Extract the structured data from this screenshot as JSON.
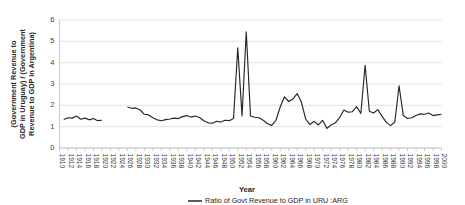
{
  "chart_data": {
    "type": "line",
    "title": "",
    "xlabel": "Year",
    "ylabel": "(Government Revenue to GDP in Uruguay) / (Government Revenue to GDP in Argentina)",
    "ylabel_lines": [
      "(Government Revenue to",
      "GDP in Uruguay) / (Government",
      "Revenue to GDP in Argentina)"
    ],
    "ylim": [
      0,
      6
    ],
    "yticks": [
      0,
      1,
      2,
      3,
      4,
      5,
      6
    ],
    "ytick_labels": [
      "0",
      "1",
      "2",
      "3",
      "4",
      "5",
      "6"
    ],
    "xlim": [
      1910,
      2000
    ],
    "xticks": [
      1910,
      1912,
      1914,
      1916,
      1918,
      1920,
      1922,
      1924,
      1926,
      1928,
      1930,
      1932,
      1934,
      1936,
      1938,
      1940,
      1942,
      1944,
      1946,
      1948,
      1950,
      1952,
      1954,
      1956,
      1958,
      1960,
      1962,
      1964,
      1966,
      1968,
      1970,
      1972,
      1974,
      1976,
      1978,
      1980,
      1982,
      1984,
      1986,
      1988,
      1990,
      1992,
      1994,
      1996,
      1998,
      2000
    ],
    "xtick_labels": [
      "1910",
      "1912",
      "1914",
      "1916",
      "1918",
      "1920",
      "1922",
      "1924",
      "1926",
      "1928",
      "1930",
      "1932",
      "1934",
      "1936",
      "1938",
      "1940",
      "1942",
      "1944",
      "1946",
      "1948",
      "1950",
      "1952",
      "1954",
      "1956",
      "1958",
      "1960",
      "1962",
      "1964",
      "1966",
      "1968",
      "1970",
      "1972",
      "1974",
      "1976",
      "1978",
      "1980",
      "1982",
      "1984",
      "1986",
      "1988",
      "1990",
      "1992",
      "1994",
      "1996",
      "1998",
      "2000"
    ],
    "grid": "horizontal",
    "legend_position": "bottom-center",
    "legend": [
      "Ratio of Govt Revenue to GDP in URU :ARG"
    ],
    "series": [
      {
        "name": "Ratio of Govt Revenue to GDP in URU :ARG",
        "color": "#262626",
        "x": [
          1911,
          1912,
          1913,
          1914,
          1915,
          1916,
          1917,
          1918,
          1919,
          1920,
          1926,
          1927,
          1928,
          1929,
          1930,
          1931,
          1932,
          1933,
          1934,
          1935,
          1936,
          1937,
          1938,
          1939,
          1940,
          1941,
          1942,
          1943,
          1944,
          1945,
          1946,
          1947,
          1948,
          1949,
          1950,
          1951,
          1952,
          1953,
          1954,
          1955,
          1956,
          1957,
          1958,
          1959,
          1960,
          1961,
          1962,
          1963,
          1964,
          1965,
          1966,
          1967,
          1968,
          1969,
          1970,
          1971,
          1972,
          1973,
          1974,
          1975,
          1976,
          1977,
          1978,
          1979,
          1980,
          1981,
          1982,
          1983,
          1984,
          1985,
          1986,
          1987,
          1988,
          1989,
          1990,
          1991,
          1992,
          1993,
          1994,
          1995,
          1996,
          1997,
          1998,
          1999,
          2000
        ],
        "values": [
          1.34,
          1.42,
          1.4,
          1.5,
          1.35,
          1.4,
          1.32,
          1.38,
          1.28,
          1.3,
          1.92,
          1.86,
          1.88,
          1.78,
          1.58,
          1.55,
          1.42,
          1.32,
          1.28,
          1.33,
          1.36,
          1.4,
          1.38,
          1.47,
          1.52,
          1.45,
          1.5,
          1.43,
          1.28,
          1.18,
          1.16,
          1.25,
          1.22,
          1.3,
          1.28,
          1.38,
          1.52,
          1.5,
          1.42,
          1.5,
          1.44,
          1.42,
          1.3,
          1.14,
          1.06,
          1.3,
          1.92,
          2.4,
          2.18,
          2.3,
          2.55,
          2.14,
          1.36,
          1.1,
          1.25,
          1.08,
          1.3,
          0.92,
          1.08,
          1.18,
          1.42,
          1.78,
          1.68,
          1.7,
          1.94,
          1.62,
          1.88,
          1.72,
          1.64,
          1.8,
          1.48,
          1.2,
          1.05,
          1.22,
          1.28,
          1.52,
          1.38,
          1.42,
          1.52,
          1.6,
          1.58,
          1.64,
          1.52,
          1.55,
          1.58
        ]
      }
    ],
    "series_scaled_note": "",
    "peaks": [
      {
        "x": 1954,
        "y": 5.45
      },
      {
        "x": 1952,
        "y": 4.7
      },
      {
        "x": 1982,
        "y": 3.88
      },
      {
        "x": 1990,
        "y": 2.92
      }
    ]
  },
  "axis_title": {
    "x": "Year"
  },
  "legend": {
    "items": [
      {
        "label": "Ratio of Govt Revenue to GDP in URU :ARG",
        "color": "#262626"
      }
    ]
  }
}
